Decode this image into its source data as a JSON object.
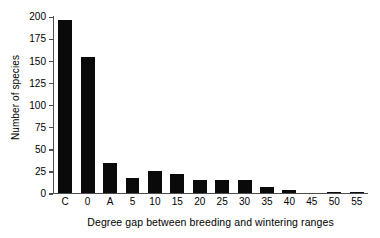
{
  "chart_data": {
    "type": "bar",
    "title": "",
    "xlabel": "Degree gap between breeding and wintering ranges",
    "ylabel": "Number of species",
    "categories": [
      "C",
      "0",
      "A",
      "5",
      "10",
      "15",
      "20",
      "25",
      "30",
      "35",
      "40",
      "45",
      "50",
      "55"
    ],
    "values": [
      195,
      154,
      34,
      16,
      25,
      21,
      14,
      14,
      14,
      6,
      3,
      0,
      1,
      1
    ],
    "ylim": [
      0,
      200
    ],
    "yticks": [
      0,
      25,
      50,
      75,
      100,
      125,
      150,
      175,
      200
    ],
    "ytick_labels": [
      "0",
      "25",
      "50",
      "75",
      "100",
      "125",
      "150",
      "175",
      "200"
    ],
    "grid": false,
    "legend": false,
    "bar_color": "#0a0a0a",
    "axis_color": "#4d4d4d",
    "background": "#ffffff"
  }
}
